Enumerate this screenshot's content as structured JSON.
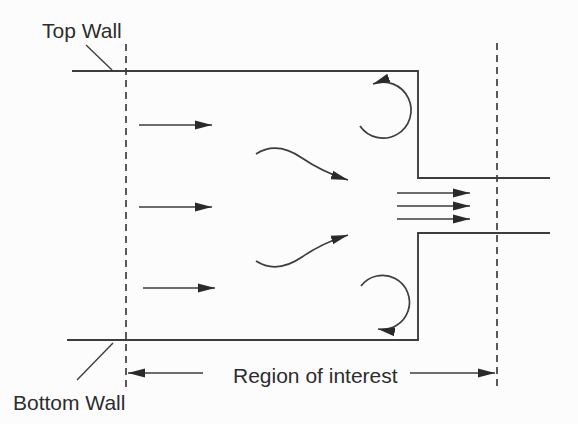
{
  "diagram": {
    "kind": "flow-schematic",
    "labels": {
      "top_wall": "Top Wall",
      "bottom_wall": "Bottom Wall",
      "region_of_interest": "Region of interest"
    },
    "colors": {
      "background": "#fcfcfc",
      "line": "#3d3d3d",
      "arrowhead": "#2a2a2a",
      "text": "#2d2d2d"
    }
  }
}
